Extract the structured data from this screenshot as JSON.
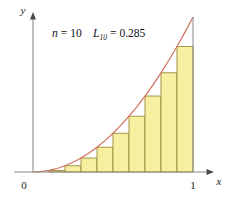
{
  "chart_data": {
    "type": "area",
    "title": "",
    "subtitle": "",
    "annotation_n": "n = 10",
    "annotation_n_symbol": "n",
    "annotation_n_value": "10",
    "annotation_L_symbol": "L",
    "annotation_L_subscript": "10",
    "annotation_L_value": "0.285",
    "annotation_full": "n = 10    L10 = 0.285",
    "xlabel": "x",
    "ylabel": "y",
    "origin_label": "0",
    "xtick_labels": [
      "0",
      "1"
    ],
    "xtick_values": [
      0,
      1
    ],
    "ytick_labels": [],
    "xlim": [
      0,
      1.06
    ],
    "ylim": [
      0,
      1.06
    ],
    "grid": false,
    "legend": null,
    "curve": {
      "name": "y = x^2",
      "expression": "x^2",
      "color": "#d0705e",
      "x": [
        0,
        0.05,
        0.1,
        0.15,
        0.2,
        0.25,
        0.3,
        0.35,
        0.4,
        0.45,
        0.5,
        0.55,
        0.6,
        0.65,
        0.7,
        0.75,
        0.8,
        0.85,
        0.9,
        0.95,
        1.0
      ],
      "y": [
        0,
        0.0025,
        0.01,
        0.0225,
        0.04,
        0.0625,
        0.09,
        0.1225,
        0.16,
        0.2025,
        0.25,
        0.3025,
        0.36,
        0.4225,
        0.49,
        0.5625,
        0.64,
        0.7225,
        0.81,
        0.9025,
        1.0
      ]
    },
    "rectangles": {
      "name": "Left-endpoint rectangles (lower sum)",
      "method": "left-endpoint",
      "count": 10,
      "width": 0.1,
      "fill_color": "#f7f0a0",
      "stroke_color": "#9c8b3c",
      "left_edges": [
        0.0,
        0.1,
        0.2,
        0.3,
        0.4,
        0.5,
        0.6,
        0.7,
        0.8,
        0.9
      ],
      "right_edges": [
        0.1,
        0.2,
        0.3,
        0.4,
        0.5,
        0.6,
        0.7,
        0.8,
        0.9,
        1.0
      ],
      "heights": [
        0.0,
        0.01,
        0.04,
        0.09,
        0.16,
        0.25,
        0.36,
        0.49,
        0.64,
        0.81
      ],
      "sum": 0.285
    }
  }
}
